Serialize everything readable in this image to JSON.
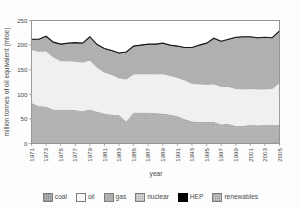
{
  "chart_data": {
    "type": "area",
    "title": "",
    "xlabel": "year",
    "ylabel": "million tonnes of oil equivalent (mtoe)",
    "ylim": [
      0,
      250
    ],
    "yticks": [
      0,
      50,
      100,
      150,
      200,
      250
    ],
    "grid": false,
    "legend_position": "bottom",
    "stacked": true,
    "x": [
      1971,
      1972,
      1973,
      1974,
      1975,
      1976,
      1977,
      1978,
      1979,
      1980,
      1981,
      1982,
      1983,
      1984,
      1985,
      1986,
      1987,
      1988,
      1989,
      1990,
      1991,
      1992,
      1993,
      1994,
      1995,
      1996,
      1997,
      1998,
      1999,
      2000,
      2001,
      2002,
      2003,
      2004,
      2005
    ],
    "xtick_labels": [
      "1971",
      "1973",
      "1975",
      "1977",
      "1979",
      "1981",
      "1983",
      "1985",
      "1987",
      "1989",
      "1991",
      "1993",
      "1995",
      "1997",
      "1999",
      "2001",
      "2003",
      "2005"
    ],
    "series": [
      {
        "name": "coal",
        "color": "#b6b6b6",
        "values": [
          83,
          76,
          75,
          69,
          68,
          68,
          68,
          66,
          69,
          65,
          61,
          59,
          58,
          45,
          63,
          63,
          63,
          62,
          61,
          59,
          56,
          50,
          45,
          44,
          44,
          44,
          39,
          40,
          36,
          36,
          38,
          37,
          38,
          38,
          38
        ]
      },
      {
        "name": "oil",
        "color": "#f0f0f0",
        "values": [
          107,
          110,
          112,
          106,
          99,
          99,
          98,
          98,
          99,
          89,
          83,
          80,
          74,
          85,
          77,
          78,
          78,
          78,
          80,
          78,
          77,
          78,
          76,
          76,
          75,
          76,
          76,
          75,
          75,
          74,
          73,
          73,
          72,
          73,
          84
        ]
      },
      {
        "name": "gas",
        "color": "#b0b0b0",
        "values": [
          21,
          25,
          30,
          30,
          34,
          36,
          38,
          39,
          48,
          46,
          48,
          49,
          51,
          55,
          57,
          58,
          60,
          61,
          62,
          62,
          64,
          66,
          73,
          79,
          84,
          93,
          92,
          96,
          104,
          106,
          105,
          104,
          105,
          103,
          106
        ]
      },
      {
        "name": "nuclear",
        "color": "#dedede",
        "values": [
          0,
          0,
          0,
          0,
          0,
          0,
          0,
          0,
          0,
          0,
          0,
          0,
          0,
          0,
          0,
          0,
          0,
          0,
          0,
          0,
          0,
          0,
          0,
          0,
          0,
          0,
          0,
          0,
          0,
          0,
          0,
          0,
          0,
          0,
          0
        ]
      },
      {
        "name": "HEP",
        "color": "#000000",
        "values": [
          1,
          1,
          1,
          1,
          1,
          1,
          1,
          1,
          1,
          1,
          1,
          1,
          1,
          1,
          1,
          1,
          1,
          1,
          1,
          1,
          1,
          1,
          1,
          1,
          1,
          1,
          1,
          1,
          1,
          1,
          1,
          1,
          1,
          1,
          1
        ]
      },
      {
        "name": "renewables",
        "color": "#c9c9c9",
        "values": [
          0,
          0,
          0,
          0,
          0,
          0,
          0,
          0,
          0,
          0,
          0,
          0,
          0,
          0,
          0,
          0,
          0,
          0,
          0,
          0,
          0,
          0,
          0,
          0,
          0,
          0,
          0,
          0,
          0,
          0,
          0,
          0,
          0,
          0,
          0
        ]
      }
    ],
    "totals": [
      212,
      212,
      219,
      206,
      202,
      204,
      205,
      204,
      218,
      201,
      193,
      189,
      184,
      186,
      198,
      200,
      202,
      202,
      204,
      200,
      198,
      195,
      195,
      200,
      204,
      214,
      208,
      212,
      216,
      217,
      217,
      215,
      216,
      215,
      229
    ]
  },
  "legend": {
    "items": [
      {
        "label": "coal",
        "color": "#b6b6b6"
      },
      {
        "label": "oil",
        "color": "#f7f7f7"
      },
      {
        "label": "gas",
        "color": "#b0b0b0"
      },
      {
        "label": "nuclear",
        "color": "#dedede"
      },
      {
        "label": "HEP",
        "color": "#000000"
      },
      {
        "label": "renewables",
        "color": "#c9c9c9"
      }
    ]
  },
  "axes": {
    "y_title": "million tonnes of oil equivalent (mtoe)",
    "x_title": "year",
    "y_ticks": [
      "0",
      "50",
      "100",
      "150",
      "200",
      "250"
    ],
    "x_ticks": [
      "1971",
      "1973",
      "1975",
      "1977",
      "1979",
      "1981",
      "1983",
      "1985",
      "1987",
      "1989",
      "1991",
      "1993",
      "1995",
      "1997",
      "1999",
      "2001",
      "2003",
      "2005"
    ]
  }
}
